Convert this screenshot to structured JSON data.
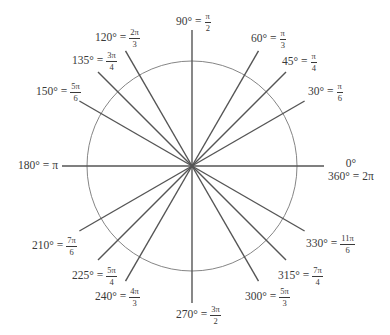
{
  "diagram": {
    "center": [
      192,
      166
    ],
    "circle_radius": 105,
    "colors": {
      "ray": "#555555",
      "circle": "#777777",
      "text": "#3a3a3a"
    },
    "angles": [
      {
        "degrees": 0,
        "label": "0°",
        "alt": "360°",
        "alt_radian": "2π",
        "ray_length": 132
      },
      {
        "degrees": 30,
        "label": "30°",
        "num": "π",
        "den": "6",
        "ray_length": 130
      },
      {
        "degrees": 45,
        "label": "45°",
        "num": "π",
        "den": "4",
        "ray_length": 133
      },
      {
        "degrees": 60,
        "label": "60°",
        "num": "π",
        "den": "3",
        "ray_length": 133
      },
      {
        "degrees": 90,
        "label": "90°",
        "num": "π",
        "den": "2",
        "ray_length": 136
      },
      {
        "degrees": 120,
        "label": "120°",
        "num": "2π",
        "den": "3",
        "ray_length": 133
      },
      {
        "degrees": 135,
        "label": "135°",
        "num": "3π",
        "den": "4",
        "ray_length": 133
      },
      {
        "degrees": 150,
        "label": "150°",
        "num": "5π",
        "den": "6",
        "ray_length": 130
      },
      {
        "degrees": 180,
        "label": "180°",
        "radian": "π",
        "ray_length": 130
      },
      {
        "degrees": 210,
        "label": "210°",
        "num": "7π",
        "den": "6",
        "ray_length": 130
      },
      {
        "degrees": 225,
        "label": "225°",
        "num": "5π",
        "den": "4",
        "ray_length": 133
      },
      {
        "degrees": 240,
        "label": "240°",
        "num": "4π",
        "den": "3",
        "ray_length": 133
      },
      {
        "degrees": 270,
        "label": "270°",
        "num": "3π",
        "den": "2",
        "ray_length": 137
      },
      {
        "degrees": 300,
        "label": "300°",
        "num": "5π",
        "den": "3",
        "ray_length": 133
      },
      {
        "degrees": 315,
        "label": "315°",
        "num": "7π",
        "den": "4",
        "ray_length": 133
      },
      {
        "degrees": 330,
        "label": "330°",
        "num": "11π",
        "den": "6",
        "ray_length": 130
      }
    ],
    "equals": "="
  }
}
